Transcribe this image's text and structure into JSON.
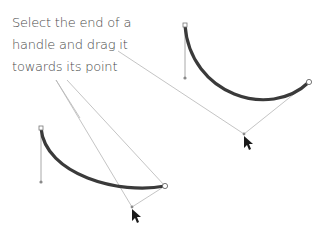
{
  "caption": {
    "lines": [
      "Select the end of a",
      "handle and drag it",
      "towards its point"
    ]
  },
  "colors": {
    "curve": "#3a3a3a",
    "guide": "#b0b0b0",
    "text": "#4a4a4a"
  },
  "figures": [
    {
      "name": "top-right-curve",
      "start": [
        185,
        25
      ],
      "handle": [
        185,
        78
      ],
      "end": [
        309,
        82
      ],
      "drag_point": [
        244,
        134
      ]
    },
    {
      "name": "bottom-left-curve",
      "start": [
        41,
        128
      ],
      "handle": [
        41,
        182
      ],
      "end": [
        165,
        186
      ],
      "drag_point": [
        132,
        207
      ]
    }
  ]
}
